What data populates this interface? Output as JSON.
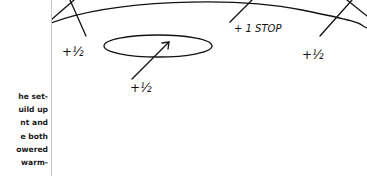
{
  "page": {
    "left_column_text_lines": [
      "he set-",
      "uild up",
      "nt and",
      "e both",
      "owered",
      "warm-"
    ]
  },
  "diagram": {
    "labels": {
      "top_center": "+ 1 STOP",
      "left": "+½",
      "right": "+½",
      "ellipse": "+½"
    },
    "stroke_color": "#111111"
  }
}
